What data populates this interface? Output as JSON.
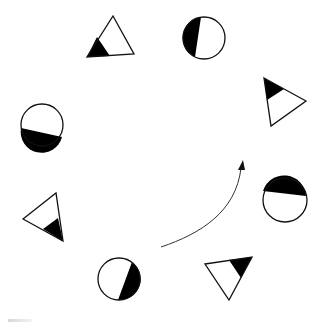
{
  "diagram": {
    "type": "shape-rotation-sequence",
    "canvas": {
      "width": 325,
      "height": 323,
      "background": "#ffffff"
    },
    "stroke_color": "#111111",
    "fill_color": "#000000",
    "shapes": [
      {
        "id": "triangle-top-left",
        "kind": "triangle",
        "points": [
          [
            113,
            16
          ],
          [
            134,
            54
          ],
          [
            87,
            57
          ]
        ],
        "black": [
          [
            87,
            57
          ],
          [
            97,
            37
          ],
          [
            110,
            56
          ]
        ]
      },
      {
        "id": "circle-top",
        "kind": "circle",
        "cx": 204,
        "cy": 38,
        "r": 21,
        "black_path": "M 201 17 A 21 21 0 0 0 195 57 Z"
      },
      {
        "id": "triangle-right",
        "kind": "triangle",
        "points": [
          [
            264,
            78
          ],
          [
            306,
            101
          ],
          [
            271,
            126
          ]
        ],
        "black": [
          [
            264,
            78
          ],
          [
            284,
            89
          ],
          [
            267,
            100
          ]
        ]
      },
      {
        "id": "circle-left",
        "kind": "circle",
        "cx": 42,
        "cy": 125,
        "r": 21,
        "black_path": "M 21 128 A 21 21 0 0 0 62 137 Z"
      },
      {
        "id": "circle-right",
        "kind": "circle",
        "cx": 285,
        "cy": 200,
        "r": 22,
        "black_path": "M 263 191 A 22 22 0 0 1 306 196 Z"
      },
      {
        "id": "triangle-left",
        "kind": "triangle",
        "points": [
          [
            23,
            219
          ],
          [
            56,
            193
          ],
          [
            63,
            241
          ]
        ],
        "black": [
          [
            63,
            241
          ],
          [
            58,
            218
          ],
          [
            43,
            229
          ]
        ]
      },
      {
        "id": "circle-bottom",
        "kind": "circle",
        "cx": 119,
        "cy": 279,
        "r": 21,
        "black_path": "M 132 262 A 21 21 0 0 1 118 300 Z"
      },
      {
        "id": "triangle-bottom-right",
        "kind": "triangle",
        "points": [
          [
            205,
            264
          ],
          [
            252,
            257
          ],
          [
            229,
            300
          ]
        ],
        "black": [
          [
            252,
            257
          ],
          [
            229,
            260
          ],
          [
            241,
            278
          ]
        ]
      }
    ],
    "arrow": {
      "path": "M 161 247 C 200 234, 236 212, 241 168",
      "head": [
        [
          243,
          160
        ],
        [
          238,
          170
        ],
        [
          245,
          170
        ]
      ],
      "color": "#333333"
    }
  }
}
